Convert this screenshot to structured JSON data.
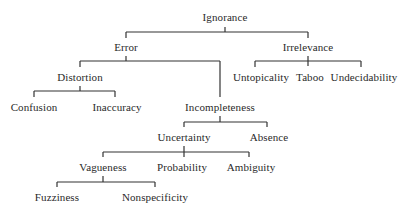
{
  "diagram": {
    "type": "taxonomy-tree",
    "line_color": "#333333",
    "text_color": "#2a2a2a",
    "nodes": [
      {
        "id": "ignorance",
        "label": "Ignorance",
        "x": 225,
        "y": 17
      },
      {
        "id": "error",
        "label": "Error",
        "x": 126,
        "y": 47
      },
      {
        "id": "irrelevance",
        "label": "Irrelevance",
        "x": 308,
        "y": 47
      },
      {
        "id": "distortion",
        "label": "Distortion",
        "x": 80,
        "y": 77
      },
      {
        "id": "untopicality",
        "label": "Untopicality",
        "x": 261,
        "y": 77
      },
      {
        "id": "taboo",
        "label": "Taboo",
        "x": 310,
        "y": 77
      },
      {
        "id": "undecidability",
        "label": "Undecidability",
        "x": 364,
        "y": 77
      },
      {
        "id": "confusion",
        "label": "Confusion",
        "x": 34,
        "y": 107
      },
      {
        "id": "inaccuracy",
        "label": "Inaccuracy",
        "x": 117,
        "y": 107
      },
      {
        "id": "incompleteness",
        "label": "Incompleteness",
        "x": 220,
        "y": 107
      },
      {
        "id": "uncertainty",
        "label": "Uncertainty",
        "x": 184,
        "y": 137
      },
      {
        "id": "absence",
        "label": "Absence",
        "x": 269,
        "y": 137
      },
      {
        "id": "vagueness",
        "label": "Vagueness",
        "x": 103,
        "y": 167
      },
      {
        "id": "probability",
        "label": "Probability",
        "x": 182,
        "y": 167
      },
      {
        "id": "ambiguity",
        "label": "Ambiguity",
        "x": 251,
        "y": 167
      },
      {
        "id": "fuzziness",
        "label": "Fuzziness",
        "x": 57,
        "y": 197
      },
      {
        "id": "nonspecificity",
        "label": "Nonspecificity",
        "x": 155,
        "y": 197
      }
    ],
    "edges": [
      {
        "parent": "ignorance",
        "children": [
          "error",
          "irrelevance"
        ]
      },
      {
        "parent": "error",
        "children": [
          "distortion",
          "incompleteness"
        ]
      },
      {
        "parent": "irrelevance",
        "children": [
          "untopicality",
          "taboo",
          "undecidability"
        ]
      },
      {
        "parent": "distortion",
        "children": [
          "confusion",
          "inaccuracy"
        ]
      },
      {
        "parent": "incompleteness",
        "children": [
          "uncertainty",
          "absence"
        ]
      },
      {
        "parent": "uncertainty",
        "children": [
          "vagueness",
          "probability",
          "ambiguity"
        ]
      },
      {
        "parent": "vagueness",
        "children": [
          "fuzziness",
          "nonspecificity"
        ]
      }
    ],
    "connectors": [
      {
        "bar_y": 32,
        "stem": [
          225,
          27
        ],
        "x1": 126,
        "x2": 308,
        "drops": [
          [
            126,
            38
          ],
          [
            308,
            38
          ]
        ]
      },
      {
        "bar_y": 61,
        "stem": [
          126,
          56
        ],
        "x1": 80,
        "x2": 220,
        "drops": [
          [
            80,
            67
          ],
          [
            220,
            97
          ]
        ]
      },
      {
        "bar_y": 61,
        "stem": [
          308,
          56
        ],
        "x1": 255,
        "x2": 361,
        "drops": [
          [
            255,
            67
          ],
          [
            308,
            66
          ],
          [
            361,
            67
          ]
        ]
      },
      {
        "bar_y": 91,
        "stem": [
          80,
          86
        ],
        "x1": 34,
        "x2": 115,
        "drops": [
          [
            34,
            97
          ],
          [
            115,
            97
          ]
        ]
      },
      {
        "bar_y": 122,
        "stem": [
          220,
          116
        ],
        "x1": 184,
        "x2": 267,
        "drops": [
          [
            184,
            127
          ],
          [
            267,
            127
          ]
        ]
      },
      {
        "bar_y": 152,
        "stem": [
          184,
          146
        ],
        "x1": 103,
        "x2": 249,
        "drops": [
          [
            103,
            157
          ],
          [
            184,
            157
          ],
          [
            249,
            157
          ]
        ]
      },
      {
        "bar_y": 182,
        "stem": [
          103,
          176
        ],
        "x1": 57,
        "x2": 155,
        "drops": [
          [
            57,
            187
          ],
          [
            155,
            187
          ]
        ]
      }
    ]
  }
}
